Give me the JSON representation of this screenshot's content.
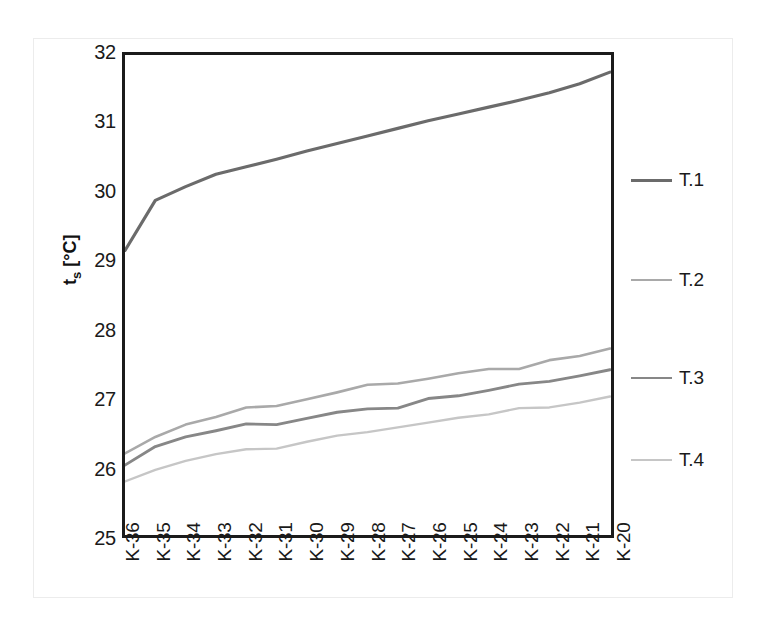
{
  "chart_data": {
    "type": "line",
    "title": "",
    "subtitle": "",
    "xlabel": "",
    "ylabel": "ts [°C]",
    "ylabel_base": "t",
    "ylabel_sub": "s",
    "ylabel_unit": " [°C]",
    "ylim": [
      25,
      32
    ],
    "yticks": [
      25,
      26,
      27,
      28,
      29,
      30,
      31,
      32
    ],
    "ytick_labels": [
      "25",
      "26",
      "27",
      "28",
      "29",
      "30",
      "31",
      "32"
    ],
    "grid": false,
    "legend_position": "right",
    "categories": [
      "K-36",
      "K-35",
      "K-34",
      "K-33",
      "K-32",
      "K-31",
      "K-30",
      "K-29",
      "K-28",
      "K-27",
      "K-26",
      "K-25",
      "K-24",
      "K-23",
      "K-22",
      "K-21",
      "K-20"
    ],
    "series": [
      {
        "name": "T.1",
        "color": "#6b6b6b",
        "width": 3.2,
        "values": [
          29.15,
          29.88,
          30.08,
          30.26,
          30.37,
          30.48,
          30.6,
          30.71,
          30.82,
          30.93,
          31.04,
          31.14,
          31.24,
          31.34,
          31.45,
          31.58,
          31.75
        ]
      },
      {
        "name": "T.2",
        "color": "#a9a9a9",
        "width": 2.6,
        "values": [
          26.19,
          26.43,
          26.61,
          26.72,
          26.86,
          26.88,
          26.98,
          27.08,
          27.19,
          27.21,
          27.28,
          27.36,
          27.42,
          27.42,
          27.55,
          27.61,
          27.72
        ]
      },
      {
        "name": "T.3",
        "color": "#878787",
        "width": 2.9,
        "values": [
          26.02,
          26.29,
          26.43,
          26.52,
          26.62,
          26.61,
          26.7,
          26.79,
          26.84,
          26.85,
          26.99,
          27.03,
          27.11,
          27.2,
          27.24,
          27.32,
          27.41
        ]
      },
      {
        "name": "T.4",
        "color": "#c6c6c6",
        "width": 2.4,
        "values": [
          25.78,
          25.95,
          26.08,
          26.18,
          26.25,
          26.26,
          26.36,
          26.45,
          26.5,
          26.57,
          26.64,
          26.71,
          26.76,
          26.85,
          26.86,
          26.93,
          27.02
        ]
      }
    ],
    "legend_entries": [
      {
        "label": "T.1",
        "color": "#6b6b6b",
        "width": 3.2
      },
      {
        "label": "T.2",
        "color": "#a9a9a9",
        "width": 2.3
      },
      {
        "label": "T.3",
        "color": "#878787",
        "width": 2.6
      },
      {
        "label": "T.4",
        "color": "#c6c6c6",
        "width": 2.2
      }
    ],
    "colors": {
      "axis": "#1b1b1b",
      "text": "#1a1a1a",
      "background": "#ffffff"
    }
  }
}
